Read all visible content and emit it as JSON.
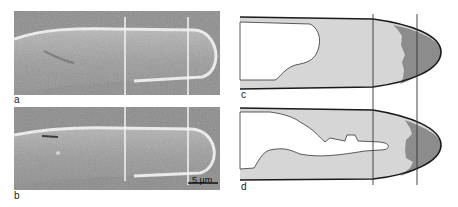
{
  "figure": {
    "panels": [
      {
        "id": "a",
        "label": "a",
        "type": "micrograph"
      },
      {
        "id": "b",
        "label": "b",
        "type": "micrograph"
      },
      {
        "id": "c",
        "label": "c",
        "type": "schematic"
      },
      {
        "id": "d",
        "label": "d",
        "type": "schematic"
      }
    ],
    "scale_bar": {
      "label": "5 µm"
    },
    "colors": {
      "micrograph_bg": "#8a8a8a",
      "cell_body": "#9a9a9a",
      "cell_edge_highlight": "#f2f2f2",
      "marker_line_light": "#f5f5f5",
      "schematic_outline": "#1a1a1a",
      "cytoplasm_fill": "#d6d6d6",
      "apical_zone_fill": "#8c8c8c",
      "vacuole_fill": "#ffffff"
    }
  }
}
